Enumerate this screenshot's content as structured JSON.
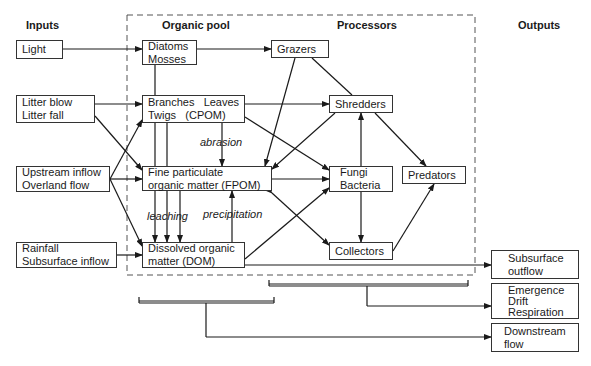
{
  "headers": {
    "inputs": "Inputs",
    "organic_pool": "Organic pool",
    "processors": "Processors",
    "outputs": "Outputs"
  },
  "inputs": {
    "light": [
      "Light"
    ],
    "litter": [
      "Litter blow",
      "Litter fall"
    ],
    "upstream": [
      "Upstream inflow",
      "Overland flow"
    ],
    "rainfall": [
      "Rainfall",
      "Subsurface inflow"
    ]
  },
  "organic_pool": {
    "diatoms": [
      "Diatoms",
      "Mosses"
    ],
    "cpom": [
      "Branches   Leaves",
      "Twigs   (CPOM)"
    ],
    "fpom": [
      "Fine particulate",
      "organic matter (FPOM)"
    ],
    "dom": [
      "Dissolved organic",
      "matter (DOM)"
    ]
  },
  "processors": {
    "grazers": [
      "Grazers"
    ],
    "shredders": [
      "Shredders"
    ],
    "fungi": [
      "Fungi",
      "Bacteria"
    ],
    "predators": [
      "Predators"
    ],
    "collectors": [
      "Collectors"
    ]
  },
  "outputs": {
    "subsurface": [
      "Subsurface",
      "outflow"
    ],
    "emergence": [
      "Emergence",
      "Drift",
      "Respiration"
    ],
    "downstream": [
      "Downstream",
      "flow"
    ]
  },
  "process_labels": {
    "abrasion": "abrasion",
    "leaching": "leaching",
    "precipitation": "precipitation"
  },
  "colors": {
    "line": "#1a1a1a",
    "box_border": "#333333",
    "background": "#ffffff"
  }
}
